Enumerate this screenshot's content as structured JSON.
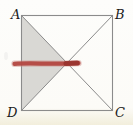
{
  "figure": {
    "labels": {
      "top_left": "A",
      "top_right": "B",
      "bottom_right": "C",
      "bottom_left": "D"
    }
  },
  "colors": {
    "line": "#8b8b8b",
    "shade_fill": "#d9d8d4",
    "marker_red": "#b2443e",
    "marker_red_halo": "#cc8c85",
    "marker_red_core": "#96312c",
    "smudge_gray": "#c9c9c5",
    "label_text": "#1b1b1b",
    "background": "#fcfbf7",
    "page_tint_bottom": "#f2eedc"
  }
}
